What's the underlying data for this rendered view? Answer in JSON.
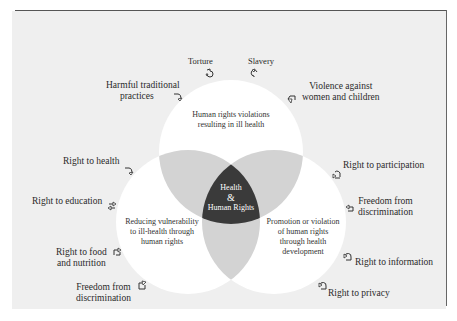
{
  "diagram": {
    "center": {
      "line1": "Health",
      "line2": "&",
      "line3": "Human Rights"
    },
    "circles": {
      "top": {
        "line1": "Human rights violations",
        "line2": "resulting in ill health"
      },
      "left": {
        "line1": "Reducing vulnerability",
        "line2": "to ill-health through",
        "line3": "human rights"
      },
      "right": {
        "line1": "Promotion or violation",
        "line2": "of human rights",
        "line3": "through health",
        "line4": "development"
      }
    },
    "top_labels": {
      "torture": "Torture",
      "slavery": "Slavery",
      "harmful_1": "Harmful traditional",
      "harmful_2": "practices",
      "violence_1": "Violence against",
      "violence_2": "women and children"
    },
    "left_labels": {
      "health": "Right to health",
      "education": "Right to education",
      "food_1": "Right to food",
      "food_2": "and nutrition",
      "freedom_1": "Freedom from",
      "freedom_2": "discrimination"
    },
    "right_labels": {
      "participation": "Right to participation",
      "freedom_1": "Freedom from",
      "freedom_2": "discrimination",
      "information": "Right to information",
      "privacy": "Right to privacy"
    },
    "colors": {
      "background": "#efefef",
      "circle": "#ffffff",
      "overlap": "#d3d3d3",
      "center": "#3a3a3a"
    },
    "icon": "curved-arrow-icon"
  }
}
